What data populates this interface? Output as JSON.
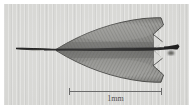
{
  "figure": {
    "kind": "light-micrograph",
    "subject_label": "leaf-scale specimen",
    "plate_background_color": "#d7d7d4",
    "border_color": "#ffffff"
  },
  "scale_bar": {
    "label": "1mm",
    "value": 1,
    "unit": "mm",
    "bar_length_px": 93,
    "line_color": "#6b6b6b",
    "text_color": "#4c4c4c",
    "tick_left_label": "",
    "tick_right_label": ""
  },
  "specimen": {
    "name": "leaf-blade",
    "outline_color": "#3b3b3b",
    "lamina_fill_color": "#8d8d8a",
    "lamina_shadow_color": "#6f6f6c",
    "midrib_color": "#1d1d1d",
    "petiole_color": "#2a2a2a",
    "parts": [
      {
        "name": "petiole",
        "description": "slender pointed stalk at left"
      },
      {
        "name": "midrib",
        "description": "dark central vein running the full length"
      },
      {
        "name": "upper-lamina",
        "description": "upper leaf half, broadly triangular"
      },
      {
        "name": "lower-lamina",
        "description": "lower leaf half, broadly triangular"
      },
      {
        "name": "apical-notch",
        "description": "emarginate notched apex at right"
      },
      {
        "name": "vein-striations",
        "description": "fine lateral veins radiating from midrib"
      }
    ]
  }
}
